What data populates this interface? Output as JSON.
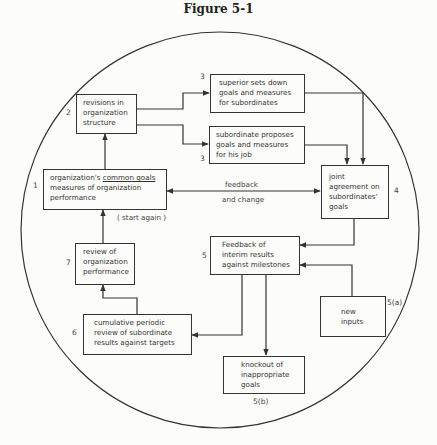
{
  "figure": {
    "title": "Figure 5-1"
  },
  "boxes": {
    "b1": {
      "number": "1",
      "line1_pre": "organization's ",
      "line1_ul": "common goals",
      "line2": "measures of organization",
      "line3": "performance"
    },
    "b2": {
      "number": "2",
      "line1": "revisions in",
      "line2": "organization",
      "line3": "structure"
    },
    "b3a": {
      "number": "3",
      "line1": "superior sets down",
      "line2": "goals and measures",
      "line3": "for subordinates"
    },
    "b3b": {
      "number": "3",
      "line1": "subordinate proposes",
      "line2": "goals and measures",
      "line3": "for his job"
    },
    "b4": {
      "number": "4",
      "line1": "joint",
      "line2": "agreement on",
      "line3": "subordinates'",
      "line4": "goals"
    },
    "b5": {
      "number": "5",
      "line1": "Feedback of",
      "line2": "interim results",
      "line3": "against milestones"
    },
    "b5a": {
      "number": "5(a)",
      "line1": "new",
      "line2": "inputs"
    },
    "b5b": {
      "number": "5(b)",
      "line1": "knockout of",
      "line2": "inappropriate",
      "line3": "goals"
    },
    "b6": {
      "number": "6",
      "line1": "cumulative periodic",
      "line2": "review of subordinate",
      "line3": "results against targets"
    },
    "b7": {
      "number": "7",
      "line1": "review of",
      "line2": "organization",
      "line3": "performance"
    }
  },
  "labels": {
    "feedback": "feedback",
    "and_change": "and change",
    "start_again": "( start again )"
  },
  "colors": {
    "line": "#333333",
    "background": "#fcfcfa"
  }
}
